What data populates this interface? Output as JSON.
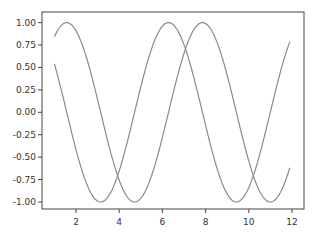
{
  "chart_data": {
    "type": "line",
    "title": "",
    "xlabel": "",
    "ylabel": "",
    "xlim": [
      0.45,
      12.55
    ],
    "ylim": [
      -1.1,
      1.1
    ],
    "grid": false,
    "legend": null,
    "x_ticks": [
      2,
      4,
      6,
      8,
      10,
      12
    ],
    "x_tick_labels": [
      "2",
      "4",
      "6",
      "8",
      "10",
      "12"
    ],
    "y_ticks": [
      1.0,
      0.75,
      0.5,
      0.25,
      0.0,
      -0.25,
      -0.5,
      -0.75,
      -1.0
    ],
    "y_tick_labels": [
      "1.00",
      "0.75",
      "0.50",
      "0.25",
      "0.00",
      "-0.25",
      "-0.50",
      "-0.75",
      "-1.00"
    ],
    "x_range": [
      1.0,
      11.9
    ],
    "series": [
      {
        "name": "sin(x)",
        "function": "sin",
        "color": "#8a8a8a",
        "x": [
          1.0,
          1.57,
          2.0,
          3.0,
          3.14,
          4.0,
          4.71,
          5.0,
          6.0,
          6.28,
          7.0,
          7.85,
          8.0,
          9.0,
          9.42,
          10.0,
          11.0,
          11.9
        ],
        "values": [
          0.84,
          1.0,
          0.91,
          0.14,
          0.0,
          -0.76,
          -1.0,
          -0.96,
          -0.28,
          0.0,
          0.66,
          1.0,
          0.99,
          0.41,
          0.0,
          -0.54,
          -1.0,
          -0.63
        ]
      },
      {
        "name": "cos(x)",
        "function": "cos",
        "color": "#8a8a8a",
        "x": [
          1.0,
          1.57,
          2.0,
          3.0,
          3.14,
          4.0,
          4.71,
          5.0,
          6.0,
          6.28,
          7.0,
          7.85,
          8.0,
          9.0,
          9.42,
          10.0,
          11.0,
          11.9
        ],
        "values": [
          0.54,
          0.0,
          -0.42,
          -0.99,
          -1.0,
          -0.65,
          0.0,
          0.28,
          0.96,
          1.0,
          0.75,
          0.0,
          -0.15,
          -0.91,
          -1.0,
          -0.84,
          0.0,
          0.79
        ]
      }
    ]
  },
  "colors": {
    "frame": "#444444",
    "line": "#8a8a8a",
    "text": "#333333"
  }
}
